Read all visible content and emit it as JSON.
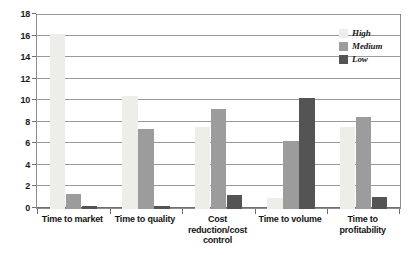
{
  "chart_data": {
    "type": "bar",
    "title": "",
    "subtitle": "",
    "xlabel": "",
    "ylabel": "",
    "ylim": [
      0,
      18
    ],
    "ytick_step": 2,
    "yticks": [
      0,
      2,
      4,
      6,
      8,
      10,
      12,
      14,
      16,
      18
    ],
    "ytick_labels": [
      "0",
      "2",
      "4",
      "6",
      "8",
      "10",
      "12",
      "14",
      "16",
      "18"
    ],
    "grid": true,
    "grid_axis": "y",
    "legend_position": "top-right",
    "categories": [
      "Time to market",
      "Time to quality",
      "Cost reduction/cost control",
      "Time to  volume",
      "Time to profitability"
    ],
    "series": [
      {
        "name": "High",
        "color": "#ededea",
        "values": [
          16.2,
          10.5,
          7.6,
          1.0,
          7.6
        ]
      },
      {
        "name": "Medium",
        "color": "#9c9c9c",
        "values": [
          1.4,
          7.4,
          9.3,
          6.3,
          8.5
        ]
      },
      {
        "name": "Low",
        "color": "#545454",
        "values": [
          0.3,
          0.3,
          1.3,
          10.3,
          1.1
        ]
      }
    ]
  },
  "legend": {
    "items": [
      {
        "label": "High"
      },
      {
        "label": "Medium"
      },
      {
        "label": "Low"
      }
    ]
  },
  "colors": {
    "high": "#ededea",
    "medium": "#9c9c9c",
    "low": "#545454",
    "gridline": "#9a9a9a",
    "axis": "#6f6f6f",
    "frame": "#8d8d8d",
    "text": "#141414",
    "background": "#ffffff"
  },
  "axes": {
    "y_min": "0",
    "y_max": "18"
  }
}
